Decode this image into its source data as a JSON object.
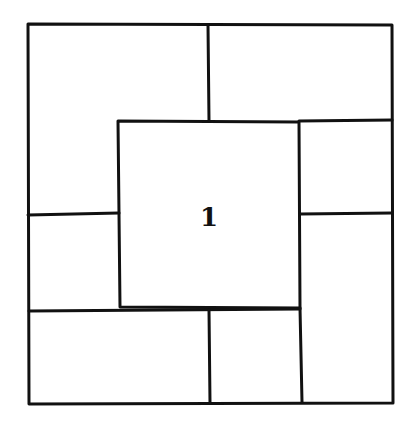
{
  "diagram": {
    "center_label": "1",
    "stroke_color": "#111111",
    "background": "#ffffff",
    "regions": [
      {
        "id": "top-left",
        "label": ""
      },
      {
        "id": "top-right",
        "label": ""
      },
      {
        "id": "right-upper",
        "label": ""
      },
      {
        "id": "right-lower",
        "label": ""
      },
      {
        "id": "bottom-middle",
        "label": ""
      },
      {
        "id": "bottom-left",
        "label": ""
      },
      {
        "id": "left-lower",
        "label": ""
      },
      {
        "id": "center",
        "label": "1"
      }
    ]
  }
}
